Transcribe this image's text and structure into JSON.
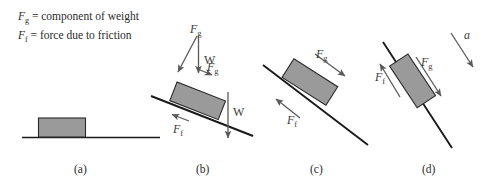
{
  "legend": {
    "lines": [
      {
        "symbol": "F",
        "subscript": "g",
        "text": "= component of weight"
      },
      {
        "symbol": "F",
        "subscript": "f",
        "text": "= force due to friction"
      }
    ]
  },
  "colors": {
    "block_fill": "#9a9a9a",
    "block_stroke": "#2a2a2a",
    "incline": "#1a1a1a",
    "arrow": "#5a5a5a",
    "text": "#2b2b2b"
  },
  "panels": [
    {
      "id": "a",
      "letter": "(a)",
      "incline_angle_deg": 0,
      "labels": [],
      "description": "block at rest on horizontal surface"
    },
    {
      "id": "b",
      "letter": "(b)",
      "incline_angle_deg": 21,
      "labels": [
        {
          "name": "fg-upper",
          "symbol": "F",
          "subscript": "g"
        },
        {
          "name": "weight-resolved",
          "symbol": "W",
          "subscript": ""
        },
        {
          "name": "fg-slope",
          "symbol": "F",
          "subscript": "g"
        },
        {
          "name": "ff",
          "symbol": "F",
          "subscript": "f"
        },
        {
          "name": "weight-vertical",
          "symbol": "W",
          "subscript": ""
        }
      ],
      "description": "shallow incline with weight resolved into components"
    },
    {
      "id": "c",
      "letter": "(c)",
      "incline_angle_deg": 32,
      "labels": [
        {
          "name": "fg",
          "symbol": "F",
          "subscript": "g"
        },
        {
          "name": "ff",
          "symbol": "F",
          "subscript": "f"
        }
      ],
      "description": "steeper incline, gravity component equals friction"
    },
    {
      "id": "d",
      "letter": "(d)",
      "incline_angle_deg": 56,
      "labels": [
        {
          "name": "acceleration",
          "symbol": "a",
          "subscript": ""
        },
        {
          "name": "fg",
          "symbol": "F",
          "subscript": "g"
        },
        {
          "name": "ff",
          "symbol": "F",
          "subscript": "f"
        }
      ],
      "description": "steepest incline, block accelerates down the slope"
    }
  ]
}
